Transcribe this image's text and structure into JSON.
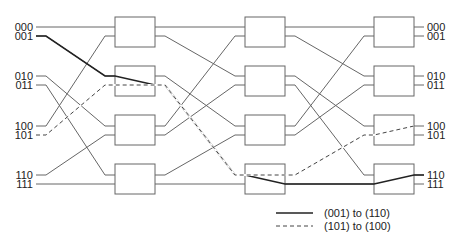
{
  "diagram": {
    "type": "omega-network",
    "stages": 3,
    "switches_per_stage": 4,
    "input_labels": [
      "000",
      "001",
      "010",
      "011",
      "100",
      "101",
      "110",
      "111"
    ],
    "output_labels": [
      "000",
      "001",
      "010",
      "011",
      "100",
      "101",
      "110",
      "111"
    ],
    "interconnect": "perfect-shuffle",
    "paths": [
      {
        "name": "(001) to (110)",
        "style": "solid-thick",
        "from": "001",
        "to": "110"
      },
      {
        "name": "(101) to (100)",
        "style": "dashed",
        "from": "101",
        "to": "100"
      }
    ]
  },
  "legend": {
    "solid_label": "(001) to (110)",
    "dashed_label": "(101) to (100)"
  },
  "colors": {
    "line": "#555555",
    "thick_line": "#222222",
    "box_stroke": "#555555",
    "text": "#222222"
  }
}
